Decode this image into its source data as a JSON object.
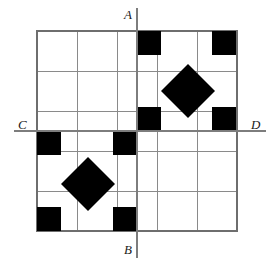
{
  "figure": {
    "background_color": "#ffffff",
    "grid": {
      "columns": 5,
      "rows": 5,
      "cell_size": 40,
      "origin_x": 37,
      "origin_y": 31,
      "width": 200,
      "height": 200,
      "line_color": "#8a8a8a",
      "border_color": "#6e6e6e"
    },
    "axes": {
      "vertical": {
        "name": "A-B",
        "x": 137,
        "y_start": 8,
        "y_end": 258,
        "color": "#7d7d7d",
        "top_label": "A",
        "bottom_label": "B"
      },
      "horizontal": {
        "name": "C-D",
        "y": 131,
        "x_start": 14,
        "x_end": 266,
        "color": "#7d7d7d",
        "left_label": "C",
        "right_label": "D"
      }
    },
    "labels": [
      {
        "text": "A",
        "x": 124,
        "y": 8
      },
      {
        "text": "B",
        "x": 124,
        "y": 243
      },
      {
        "text": "C",
        "x": 18,
        "y": 118
      },
      {
        "text": "D",
        "x": 251,
        "y": 118
      }
    ],
    "shape_color": "#000000",
    "square_size": 24,
    "squares": [
      {
        "id": "sq-top-col3",
        "x": 137,
        "y": 31,
        "size": 24,
        "cell": "r1c3",
        "corner": "top-left"
      },
      {
        "id": "sq-top-right",
        "x": 212,
        "y": 31,
        "size": 24,
        "cell": "r1c5",
        "corner": "top-right"
      },
      {
        "id": "sq-mid-col3",
        "x": 137,
        "y": 107,
        "size": 24,
        "cell": "r3c3",
        "corner": "bottom-left"
      },
      {
        "id": "sq-mid-right",
        "x": 212,
        "y": 107,
        "size": 24,
        "cell": "r3c5",
        "corner": "bottom-right"
      },
      {
        "id": "sq-left-below-c",
        "x": 37,
        "y": 131,
        "size": 24,
        "cell": "r4c1",
        "corner": "top-left"
      },
      {
        "id": "sq-col3-below-c",
        "x": 113,
        "y": 131,
        "size": 24,
        "cell": "r4c2",
        "corner": "top-right"
      },
      {
        "id": "sq-bottom-left",
        "x": 37,
        "y": 207,
        "size": 24,
        "cell": "r5c1",
        "corner": "bottom-left"
      },
      {
        "id": "sq-bottom-col3",
        "x": 113,
        "y": 207,
        "size": 24,
        "cell": "r5c2",
        "corner": "bottom-right"
      }
    ],
    "diamond_radius": 27,
    "diamonds": [
      {
        "id": "diamond-upper-right",
        "cx": 188,
        "cy": 91,
        "r": 27
      },
      {
        "id": "diamond-lower-left",
        "cx": 88,
        "cy": 184,
        "r": 27
      }
    ]
  }
}
